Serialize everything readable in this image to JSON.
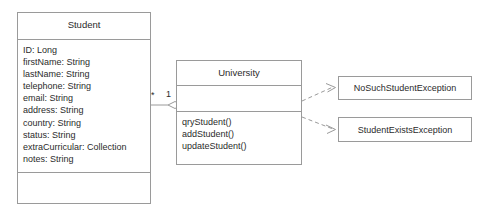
{
  "diagram": {
    "kind": "uml-class-diagram",
    "background_color": "#ffffff",
    "line_color": "#9a9a9a",
    "text_color": "#2b2b2b"
  },
  "classes": [
    {
      "id": "student",
      "name": "Student",
      "attributes": [
        "ID: Long",
        "firstName: String",
        "lastName: String",
        "telephone: String",
        "email: String",
        "address: String",
        "country: String",
        "status: String",
        "extraCurricular: Collection",
        "notes: String"
      ],
      "operations": []
    },
    {
      "id": "university",
      "name": "University",
      "attributes": [],
      "operations": [
        "qryStudent()",
        "addStudent()",
        "updateStudent()"
      ]
    }
  ],
  "exceptions": [
    {
      "id": "no-such-student-exception",
      "name": "NoSuchStudentException"
    },
    {
      "id": "student-exists-exception",
      "name": "StudentExistsException"
    }
  ],
  "association": {
    "type": "aggregation",
    "source": "Student",
    "target": "University",
    "source_multiplicity": "*",
    "target_multiplicity": "1"
  },
  "dependencies": [
    {
      "from": "University",
      "to": "NoSuchStudentException",
      "style": "dashed-open-arrow"
    },
    {
      "from": "University",
      "to": "StudentExistsException",
      "style": "dashed-open-arrow"
    }
  ]
}
